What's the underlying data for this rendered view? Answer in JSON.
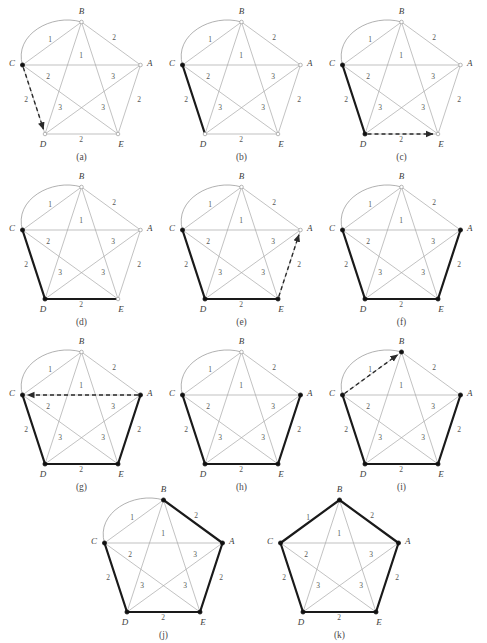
{
  "figure": {
    "title": "",
    "vertices": [
      "A",
      "B",
      "C",
      "D",
      "E"
    ],
    "vertex_positions": {
      "B": [
        81.5,
        22
      ],
      "A": [
        140.5,
        65
      ],
      "C": [
        22.5,
        65
      ],
      "D": [
        45,
        134
      ],
      "E": [
        118,
        134
      ]
    },
    "edge_weights": {
      "BA": "2",
      "BC": "1",
      "CA": "1",
      "CD": "2",
      "DE": "2",
      "EA": "2",
      "CE": "2",
      "BD": "3",
      "BE": "3",
      "AD": "3",
      "arc_CB": "1"
    },
    "colors": {
      "thin_edge": "#a8a8a8",
      "bold_edge": "#1a1a1a",
      "dashed_edge": "#2a2a2a",
      "label": "#555555",
      "vertex_label": "#404040",
      "caption": "#4a4a4a",
      "background": "#ffffff"
    }
  },
  "panels": [
    {
      "id": "a",
      "caption": "(a)",
      "bold_edges": [],
      "dashed_edges": [
        "CD"
      ],
      "filled_nodes": [
        "C"
      ],
      "has_arc": true,
      "col": 0,
      "row": 0
    },
    {
      "id": "b",
      "caption": "(b)",
      "bold_edges": [
        "CD"
      ],
      "dashed_edges": [],
      "filled_nodes": [
        "C"
      ],
      "has_arc": true,
      "col": 1,
      "row": 0
    },
    {
      "id": "c",
      "caption": "(c)",
      "bold_edges": [
        "CD"
      ],
      "dashed_edges": [
        "DE"
      ],
      "filled_nodes": [
        "C",
        "D"
      ],
      "has_arc": true,
      "col": 2,
      "row": 0
    },
    {
      "id": "d",
      "caption": "(d)",
      "bold_edges": [
        "CD",
        "DE"
      ],
      "dashed_edges": [],
      "filled_nodes": [
        "C",
        "D"
      ],
      "has_arc": true,
      "col": 0,
      "row": 1
    },
    {
      "id": "e",
      "caption": "(e)",
      "bold_edges": [
        "CD",
        "DE"
      ],
      "dashed_edges": [
        "EA"
      ],
      "filled_nodes": [
        "C",
        "D",
        "E"
      ],
      "has_arc": true,
      "col": 1,
      "row": 1
    },
    {
      "id": "f",
      "caption": "(f)",
      "bold_edges": [
        "CD",
        "DE",
        "EA"
      ],
      "dashed_edges": [],
      "filled_nodes": [
        "C",
        "D",
        "E",
        "A"
      ],
      "has_arc": true,
      "col": 2,
      "row": 1
    },
    {
      "id": "g",
      "caption": "(g)",
      "bold_edges": [
        "CD",
        "DE",
        "EA"
      ],
      "dashed_edges": [
        "AC"
      ],
      "filled_nodes": [
        "C",
        "D",
        "E",
        "A"
      ],
      "has_arc": true,
      "col": 0,
      "row": 2
    },
    {
      "id": "h",
      "caption": "(h)",
      "bold_edges": [
        "CD",
        "DE",
        "EA"
      ],
      "dashed_edges": [],
      "filled_nodes": [
        "C",
        "D",
        "E",
        "A"
      ],
      "has_arc": true,
      "col": 1,
      "row": 2
    },
    {
      "id": "i",
      "caption": "(i)",
      "bold_edges": [
        "CD",
        "DE",
        "EA"
      ],
      "dashed_edges": [
        "CB"
      ],
      "filled_nodes": [
        "C",
        "D",
        "E",
        "A",
        "B"
      ],
      "has_arc": true,
      "col": 2,
      "row": 2
    },
    {
      "id": "j",
      "caption": "(j)",
      "bold_edges": [
        "CD",
        "DE",
        "EA",
        "AB"
      ],
      "dashed_edges": [],
      "filled_nodes": [
        "C",
        "D",
        "E",
        "A",
        "B"
      ],
      "has_arc": true,
      "col": 0,
      "row": 3
    },
    {
      "id": "k",
      "caption": "(k)",
      "bold_edges": [
        "CD",
        "DE",
        "EA",
        "AB",
        "BC"
      ],
      "dashed_edges": [],
      "filled_nodes": [
        "C",
        "D",
        "E",
        "A",
        "B"
      ],
      "has_arc": false,
      "col": 1,
      "row": 3
    }
  ]
}
